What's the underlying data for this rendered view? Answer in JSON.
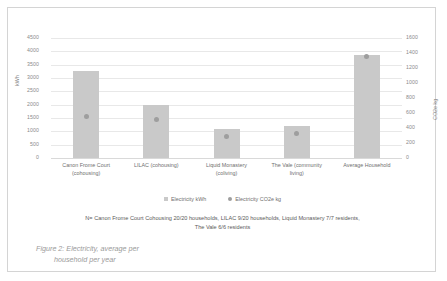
{
  "figure": {
    "caption_line1": "Figure 2: Electricity, average per",
    "caption_line2": "household per year"
  },
  "footnote": {
    "line1": "N= Canon Frome Court Cohousing 20/20 households, LILAC 9/20 households, Liquid Monastery 7/7 residents,",
    "line2": "The Vale 6/6 residents"
  },
  "legend": {
    "items": [
      {
        "label": "Electricity kWh",
        "marker": "square",
        "color": "#c9c9c9"
      },
      {
        "label": "Electricity CO2e kg",
        "marker": "circle",
        "color": "#9e9e9e"
      }
    ]
  },
  "chart_data": {
    "type": "bar",
    "title": "",
    "categories": [
      "Canon Frome Court (cohousing)",
      "LILAC (cohousing)",
      "Liquid Monastery (coliving)",
      "The Vale (community living)",
      "Average Household"
    ],
    "category_lines": [
      [
        "Canon Frome Court",
        "(cohousing)"
      ],
      [
        "LILAC (cohousing)",
        ""
      ],
      [
        "Liquid Monastery",
        "(coliving)"
      ],
      [
        "The Vale (community",
        "living)"
      ],
      [
        "Average Household",
        ""
      ]
    ],
    "series": [
      {
        "name": "Electricity kWh",
        "type": "bar",
        "axis": "left",
        "color": "#c9c9c9",
        "values": [
          3250,
          2000,
          1100,
          1200,
          3850
        ]
      },
      {
        "name": "Electricity CO2e kg",
        "type": "scatter",
        "axis": "right",
        "color": "#9e9e9e",
        "values": [
          550,
          520,
          290,
          330,
          1350
        ]
      }
    ],
    "xlabel": "",
    "ylabel": "kWh",
    "y2label": "CO2e kg",
    "ylim": [
      0,
      4500
    ],
    "y2lim": [
      0,
      1600
    ],
    "yticks": [
      0,
      500,
      1000,
      1500,
      2000,
      2500,
      3000,
      3500,
      4000,
      4500
    ],
    "y2ticks": [
      0,
      200,
      400,
      600,
      800,
      1000,
      1200,
      1400,
      1600
    ],
    "ytick_labels": [
      "0",
      "500",
      "1000",
      "1500",
      "2000",
      "2500",
      "3000",
      "3500",
      "4000",
      "4500"
    ],
    "y2tick_labels": [
      "0",
      "200",
      "400",
      "600",
      "800",
      "1000",
      "1200",
      "1400",
      "1600"
    ],
    "grid": true,
    "legend_position": "bottom"
  }
}
